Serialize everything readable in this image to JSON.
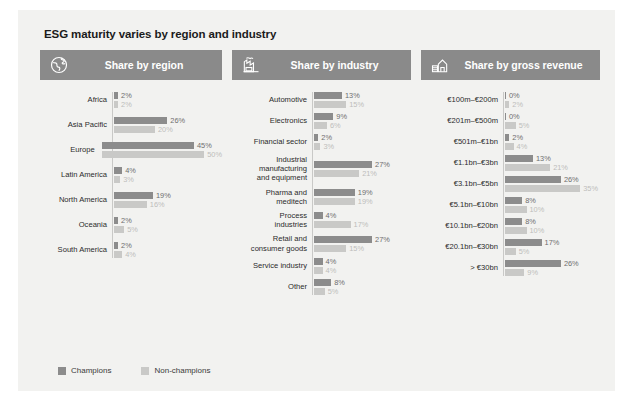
{
  "title": "ESG maturity varies by region and industry",
  "legend": {
    "champions": "Champions",
    "non_champions": "Non-champions",
    "champions_color": "#8c8c8c",
    "non_champions_color": "#c9c9c7"
  },
  "panels": {
    "region": {
      "pill_label": "Share by region",
      "icon": "globe-icon"
    },
    "industry": {
      "pill_label": "Share by industry",
      "icon": "factory-icon"
    },
    "revenue": {
      "pill_label": "Share by gross revenue",
      "icon": "revenue-building-icon"
    }
  },
  "chart_data": [
    {
      "type": "bar",
      "title": "Share by region",
      "orientation": "horizontal",
      "xlabel": "",
      "ylabel": "",
      "xlim": [
        0,
        50
      ],
      "grid": false,
      "legend_position": "bottom",
      "categories": [
        "Africa",
        "Asia Pacific",
        "Europe",
        "Latin America",
        "North America",
        "Oceania",
        "South America"
      ],
      "series": [
        {
          "name": "Champions",
          "values": [
            2,
            26,
            45,
            4,
            19,
            2,
            2
          ],
          "labels": [
            "2%",
            "26%",
            "45%",
            "4%",
            "19%",
            "2%",
            "2%"
          ]
        },
        {
          "name": "Non-champions",
          "values": [
            2,
            20,
            50,
            3,
            16,
            5,
            4
          ],
          "labels": [
            "2%",
            "20%",
            "50%",
            "3%",
            "16%",
            "5%",
            "4%"
          ]
        }
      ]
    },
    {
      "type": "bar",
      "title": "Share by industry",
      "orientation": "horizontal",
      "xlabel": "",
      "ylabel": "",
      "xlim": [
        0,
        30
      ],
      "grid": false,
      "legend_position": "bottom",
      "categories": [
        "Automotive",
        "Electronics",
        "Financial sector",
        "Industrial\nmanufacturing\nand equipment",
        "Pharma and\nmeditech",
        "Process\nindustries",
        "Retail and\nconsumer goods",
        "Service industry",
        "Other"
      ],
      "series": [
        {
          "name": "Champions",
          "values": [
            13,
            9,
            2,
            27,
            19,
            4,
            27,
            4,
            8
          ],
          "labels": [
            "13%",
            "9%",
            "2%",
            "27%",
            "19%",
            "4%",
            "27%",
            "4%",
            "8%"
          ]
        },
        {
          "name": "Non-champions",
          "values": [
            15,
            6,
            3,
            21,
            19,
            17,
            15,
            4,
            5
          ],
          "labels": [
            "15%",
            "6%",
            "3%",
            "21%",
            "19%",
            "17%",
            "15%",
            "4%",
            "5%"
          ]
        }
      ]
    },
    {
      "type": "bar",
      "title": "Share by gross revenue",
      "orientation": "horizontal",
      "xlabel": "",
      "ylabel": "",
      "xlim": [
        0,
        35
      ],
      "grid": false,
      "legend_position": "bottom",
      "categories": [
        "€100m–€200m",
        "€201m–€500m",
        "€501m–€1bn",
        "€1.1bn–€3bn",
        "€3.1bn–€5bn",
        "€5.1bn–€10bn",
        "€10.1bn–€20bn",
        "€20.1bn–€30bn",
        "> €30bn"
      ],
      "series": [
        {
          "name": "Champions",
          "values": [
            0,
            0,
            2,
            13,
            26,
            8,
            8,
            17,
            26
          ],
          "labels": [
            "0%",
            "0%",
            "2%",
            "13%",
            "26%",
            "8%",
            "8%",
            "17%",
            "26%"
          ]
        },
        {
          "name": "Non-champions",
          "values": [
            2,
            5,
            4,
            21,
            35,
            10,
            10,
            5,
            9
          ],
          "labels": [
            "2%",
            "5%",
            "4%",
            "21%",
            "35%",
            "10%",
            "10%",
            "5%",
            "9%"
          ]
        }
      ]
    }
  ]
}
